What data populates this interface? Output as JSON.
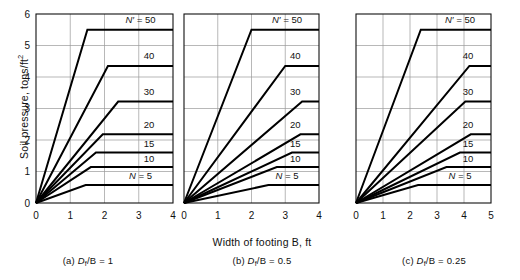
{
  "figure": {
    "xlabel": "Width of footing B, ft",
    "ylabel_text": "Soil pressure, tons/ft",
    "ylabel_exponent": "2"
  },
  "chart_data": [
    {
      "type": "line",
      "panel_id": "a",
      "caption_prefix": "(a)",
      "caption_symbol": "D",
      "caption_sub": "f",
      "caption_rest": "/B = 1",
      "caption_full": "(a) Df/B = 1",
      "title": "",
      "xlabel": "Width of footing B, ft",
      "ylabel": "Soil pressure, tons/ft2",
      "xlim": [
        0,
        4
      ],
      "ylim": [
        0,
        6
      ],
      "xticks": [
        0,
        1,
        2,
        3,
        4
      ],
      "yticks": [
        0,
        1,
        2,
        3,
        4,
        5,
        6
      ],
      "show_ytick_labels": true,
      "grid": true,
      "legend": "inline-labels",
      "series": [
        {
          "name": "N' = 50",
          "label": "50",
          "label_prefix": "N′ = ",
          "plateau": 5.5,
          "knee_x": 1.5,
          "label_x": 3.05,
          "label_y": 5.82,
          "points": [
            [
              0,
              0
            ],
            [
              1.5,
              5.5
            ],
            [
              4,
              5.5
            ]
          ]
        },
        {
          "name": "40",
          "label": "40",
          "label_prefix": "",
          "plateau": 4.35,
          "knee_x": 2.1,
          "label_x": 3.3,
          "label_y": 4.67,
          "points": [
            [
              0,
              0
            ],
            [
              2.1,
              4.35
            ],
            [
              4,
              4.35
            ]
          ]
        },
        {
          "name": "30",
          "label": "30",
          "label_prefix": "",
          "plateau": 3.22,
          "knee_x": 2.4,
          "label_x": 3.3,
          "label_y": 3.55,
          "points": [
            [
              0,
              0
            ],
            [
              2.4,
              3.22
            ],
            [
              4,
              3.22
            ]
          ]
        },
        {
          "name": "20",
          "label": "20",
          "label_prefix": "",
          "plateau": 2.18,
          "knee_x": 1.95,
          "label_x": 3.3,
          "label_y": 2.5,
          "points": [
            [
              0,
              0
            ],
            [
              1.95,
              2.18
            ],
            [
              4,
              2.18
            ]
          ]
        },
        {
          "name": "15",
          "label": "15",
          "label_prefix": "",
          "plateau": 1.6,
          "knee_x": 1.75,
          "label_x": 3.3,
          "label_y": 1.9,
          "points": [
            [
              0,
              0
            ],
            [
              1.75,
              1.6
            ],
            [
              4,
              1.6
            ]
          ]
        },
        {
          "name": "10",
          "label": "10",
          "label_prefix": "",
          "plateau": 1.14,
          "knee_x": 1.6,
          "label_x": 3.3,
          "label_y": 1.42,
          "points": [
            [
              0,
              0
            ],
            [
              1.6,
              1.14
            ],
            [
              4,
              1.14
            ]
          ]
        },
        {
          "name": "N = 5",
          "label": "5",
          "label_prefix": "N = ",
          "plateau": 0.57,
          "knee_x": 1.45,
          "label_x": 3.05,
          "label_y": 0.88,
          "points": [
            [
              0,
              0
            ],
            [
              1.45,
              0.57
            ],
            [
              4,
              0.57
            ]
          ]
        }
      ]
    },
    {
      "type": "line",
      "panel_id": "b",
      "caption_prefix": "(b)",
      "caption_symbol": "D",
      "caption_sub": "f",
      "caption_rest": "/B = 0.5",
      "caption_full": "(b) Df/B = 0.5",
      "title": "",
      "xlabel": "Width of footing B, ft",
      "ylabel": "",
      "xlim": [
        0,
        4
      ],
      "ylim": [
        0,
        6
      ],
      "xticks": [
        0,
        1,
        2,
        3,
        4
      ],
      "yticks": [
        0,
        1,
        2,
        3,
        4,
        5,
        6
      ],
      "show_ytick_labels": false,
      "grid": true,
      "legend": "inline-labels",
      "series": [
        {
          "name": "N' = 50",
          "label": "50",
          "label_prefix": "N′ = ",
          "plateau": 5.5,
          "knee_x": 2.0,
          "label_x": 3.05,
          "label_y": 5.82,
          "points": [
            [
              0,
              0
            ],
            [
              2.0,
              5.5
            ],
            [
              4,
              5.5
            ]
          ]
        },
        {
          "name": "40",
          "label": "40",
          "label_prefix": "",
          "plateau": 4.35,
          "knee_x": 3.0,
          "label_x": 3.3,
          "label_y": 4.67,
          "points": [
            [
              0,
              0
            ],
            [
              3.0,
              4.35
            ],
            [
              4,
              4.35
            ]
          ]
        },
        {
          "name": "30",
          "label": "30",
          "label_prefix": "",
          "plateau": 3.22,
          "knee_x": 3.5,
          "label_x": 3.3,
          "label_y": 3.55,
          "points": [
            [
              0,
              0
            ],
            [
              3.5,
              3.22
            ],
            [
              4,
              3.22
            ]
          ]
        },
        {
          "name": "20",
          "label": "20",
          "label_prefix": "",
          "plateau": 2.18,
          "knee_x": 3.45,
          "label_x": 3.3,
          "label_y": 2.5,
          "points": [
            [
              0,
              0
            ],
            [
              3.45,
              2.18
            ],
            [
              4,
              2.18
            ]
          ]
        },
        {
          "name": "15",
          "label": "15",
          "label_prefix": "",
          "plateau": 1.6,
          "knee_x": 3.2,
          "label_x": 3.3,
          "label_y": 1.9,
          "points": [
            [
              0,
              0
            ],
            [
              3.2,
              1.6
            ],
            [
              4,
              1.6
            ]
          ]
        },
        {
          "name": "10",
          "label": "10",
          "label_prefix": "",
          "plateau": 1.14,
          "knee_x": 2.75,
          "label_x": 3.3,
          "label_y": 1.42,
          "points": [
            [
              0,
              0
            ],
            [
              2.75,
              1.14
            ],
            [
              4,
              1.14
            ]
          ]
        },
        {
          "name": "N = 5",
          "label": "5",
          "label_prefix": "N = ",
          "plateau": 0.57,
          "knee_x": 2.5,
          "label_x": 3.05,
          "label_y": 0.88,
          "points": [
            [
              0,
              0
            ],
            [
              2.5,
              0.57
            ],
            [
              4,
              0.57
            ]
          ]
        }
      ]
    },
    {
      "type": "line",
      "panel_id": "c",
      "caption_prefix": "(c)",
      "caption_symbol": "D",
      "caption_sub": "f",
      "caption_rest": "/B = 0.25",
      "caption_full": "(c) Df/B = 0.25",
      "title": "",
      "xlabel": "Width of footing B, ft",
      "ylabel": "",
      "xlim": [
        0,
        5
      ],
      "ylim": [
        0,
        6
      ],
      "xticks": [
        0,
        1,
        2,
        3,
        4,
        5
      ],
      "yticks": [
        0,
        1,
        2,
        3,
        4,
        5,
        6
      ],
      "show_ytick_labels": false,
      "grid": true,
      "legend": "inline-labels",
      "series": [
        {
          "name": "N' = 50",
          "label": "50",
          "label_prefix": "N′ = ",
          "plateau": 5.5,
          "knee_x": 2.4,
          "label_x": 3.85,
          "label_y": 5.82,
          "points": [
            [
              0,
              0
            ],
            [
              2.4,
              5.5
            ],
            [
              5,
              5.5
            ]
          ]
        },
        {
          "name": "40",
          "label": "40",
          "label_prefix": "",
          "plateau": 4.35,
          "knee_x": 4.2,
          "label_x": 4.15,
          "label_y": 4.67,
          "points": [
            [
              0,
              0
            ],
            [
              4.2,
              4.35
            ],
            [
              5,
              4.35
            ]
          ]
        },
        {
          "name": "30",
          "label": "30",
          "label_prefix": "",
          "plateau": 3.22,
          "knee_x": 4.05,
          "label_x": 4.15,
          "label_y": 3.55,
          "points": [
            [
              0,
              0
            ],
            [
              4.05,
              3.22
            ],
            [
              5,
              3.22
            ]
          ]
        },
        {
          "name": "20",
          "label": "20",
          "label_prefix": "",
          "plateau": 2.18,
          "knee_x": 4.25,
          "label_x": 4.15,
          "label_y": 2.5,
          "points": [
            [
              0,
              0
            ],
            [
              4.25,
              2.18
            ],
            [
              5,
              2.18
            ]
          ]
        },
        {
          "name": "15",
          "label": "15",
          "label_prefix": "",
          "plateau": 1.6,
          "knee_x": 3.85,
          "label_x": 4.15,
          "label_y": 1.9,
          "points": [
            [
              0,
              0
            ],
            [
              3.85,
              1.6
            ],
            [
              5,
              1.6
            ]
          ]
        },
        {
          "name": "10",
          "label": "10",
          "label_prefix": "",
          "plateau": 1.14,
          "knee_x": 3.35,
          "label_x": 4.15,
          "label_y": 1.42,
          "points": [
            [
              0,
              0
            ],
            [
              3.35,
              1.14
            ],
            [
              5,
              1.14
            ]
          ]
        },
        {
          "name": "N = 5",
          "label": "5",
          "label_prefix": "N = ",
          "plateau": 0.57,
          "knee_x": 2.3,
          "label_x": 3.85,
          "label_y": 0.88,
          "points": [
            [
              0,
              0
            ],
            [
              2.3,
              0.57
            ],
            [
              5,
              0.57
            ]
          ]
        }
      ]
    }
  ]
}
